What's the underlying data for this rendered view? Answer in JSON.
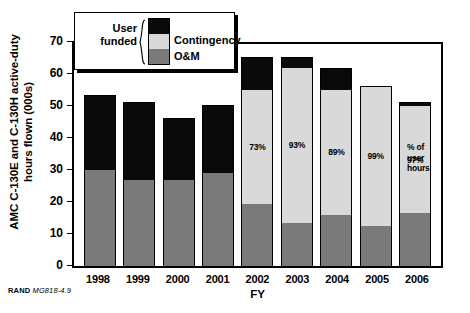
{
  "chart_data": {
    "type": "bar",
    "title": "",
    "xlabel": "FY",
    "ylabel_lines": [
      "AMC C-130E and C-130H active-duty",
      "hours flown  (000s)"
    ],
    "ylabel": "AMC C-130E and C-130H active-duty hours flown (000s)",
    "ylim": [
      0,
      70
    ],
    "yticks": [
      0,
      10,
      20,
      30,
      40,
      50,
      60,
      70
    ],
    "ytick_labels": [
      "0",
      "10",
      "20",
      "30",
      "40",
      "50",
      "60",
      "70"
    ],
    "grid": false,
    "stacked": true,
    "legend_position": "top-left-inset",
    "categories": [
      "1998",
      "1999",
      "2000",
      "2001",
      "2002",
      "2003",
      "2004",
      "2005",
      "2006"
    ],
    "series": [
      {
        "name": "O&M",
        "color": "#7a7a7a",
        "values": [
          30,
          27,
          27,
          29,
          19.5,
          13.5,
          16,
          12.5,
          16.5
        ]
      },
      {
        "name": "Contingency",
        "color": "#d9d9d9",
        "values": [
          0,
          0,
          0,
          0,
          35.5,
          48.5,
          39,
          43.5,
          33.5
        ]
      },
      {
        "name": "User funded",
        "color": "#0a0a0a",
        "values": [
          23,
          24,
          19,
          21,
          10,
          3,
          6.5,
          0,
          1
        ]
      }
    ],
    "totals": [
      53,
      51,
      46,
      50,
      65,
      65,
      61.5,
      56,
      51
    ],
    "annotations": [
      {
        "category": "2002",
        "text": "73%"
      },
      {
        "category": "2003",
        "text": "93%"
      },
      {
        "category": "2004",
        "text": "89%"
      },
      {
        "category": "2005",
        "text": "99%"
      },
      {
        "category": "2006",
        "text": "97%"
      }
    ],
    "annotation_note_lines": [
      "% of",
      "user",
      "hours"
    ]
  },
  "legend": {
    "user_funded_line1": "User",
    "user_funded_line2": "funded",
    "contingency_label": "Contingency",
    "om_label": "O&M"
  },
  "axes": {
    "x_title": "FY",
    "y_title_line1": "AMC C-130E and C-130H active-duty",
    "y_title_line2": "hours flown  (000s)",
    "x_categories": [
      "1998",
      "1999",
      "2000",
      "2001",
      "2002",
      "2003",
      "2004",
      "2005",
      "2006"
    ],
    "y_tick_labels": [
      "70",
      "60",
      "50",
      "40",
      "30",
      "20",
      "10",
      "0"
    ]
  },
  "annotation": {
    "pct_line1": "% of",
    "pct_line2": "user",
    "pct_line3": "hours"
  },
  "source": {
    "org": "RAND",
    "id": "MG818-4.9"
  },
  "colors": {
    "user_funded": "#0a0a0a",
    "contingency": "#d9d9d9",
    "om": "#7a7a7a",
    "axis": "#000000",
    "background": "#ffffff"
  }
}
